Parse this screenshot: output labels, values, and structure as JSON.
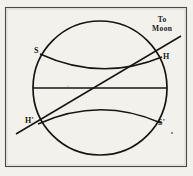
{
  "figure": {
    "domain": "diagram",
    "background_color": "#f3f1ec",
    "ink_color": "#1a1a1a",
    "frame": {
      "name": "plate-border",
      "x": 5,
      "y": 7,
      "width": 182,
      "height": 160
    },
    "labels": {
      "s": "S",
      "h": "H",
      "h_prime": "H'",
      "s_prime": "S'",
      "to_moon_line_1": "To",
      "to_moon_line_2": "Moon"
    },
    "geometry": {
      "earth_circle": {
        "cx": 100,
        "cy": 88,
        "r": 67
      },
      "equator_line": {
        "x1": 33,
        "y1": 88,
        "x2": 167,
        "y2": 88
      },
      "upper_horizon_arc": {
        "from": "S",
        "to": "H",
        "sag": "downward"
      },
      "lower_horizon_arc": {
        "from": "H'",
        "to": "S'",
        "sag": "upward"
      },
      "moon_direction_line": {
        "x1": 16,
        "y1": 134,
        "x2": 181,
        "y2": 36
      }
    }
  }
}
